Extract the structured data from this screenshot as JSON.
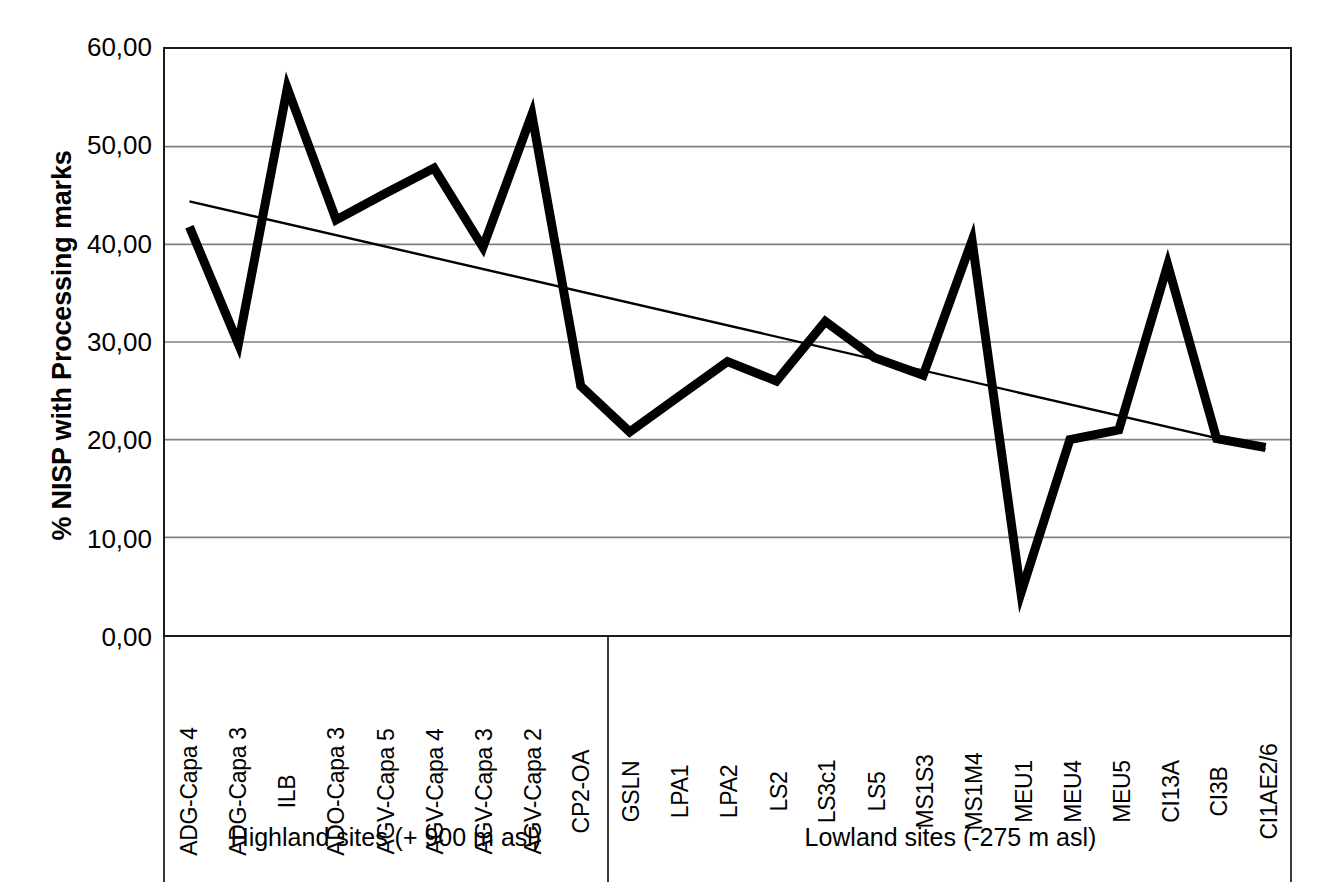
{
  "chart_data": {
    "type": "line",
    "title": "",
    "xlabel": "",
    "ylabel": "% NISP with Processing marks",
    "ylim": [
      0,
      60
    ],
    "ytick_labels": [
      "60,00",
      "50,00",
      "40,00",
      "30,00",
      "20,00",
      "10,00",
      "0,00"
    ],
    "ytick_values": [
      60,
      50,
      40,
      30,
      20,
      10,
      0
    ],
    "grid": "horizontal",
    "legend": "none",
    "categories": [
      "ADG-Capa 4",
      "ADG-Capa 3",
      "ILB",
      "ADO-Capa 3",
      "AGV-Capa 5",
      "AGV-Capa 4",
      "AGV-Capa 3",
      "AGV-Capa 2",
      "CP2-OA",
      "GSLN",
      "LPA1",
      "LPA2",
      "LS2",
      "LS3c1",
      "LS5",
      "MS1S3",
      "MS1M4",
      "MEU1",
      "MEU4",
      "MEU5",
      "CI13A",
      "CI3B",
      "CI1AE2/6"
    ],
    "series": [
      {
        "name": "% NISP with Processing marks",
        "values": [
          41.8,
          29.8,
          56.0,
          42.5,
          45.2,
          47.8,
          39.7,
          53.3,
          25.5,
          20.8,
          24.4,
          28.0,
          26.0,
          32.1,
          28.4,
          26.6,
          40.4,
          4.3,
          20.0,
          21.0,
          37.9,
          20.1,
          19.2
        ]
      },
      {
        "name": "Linear trendline",
        "type": "trendline",
        "endpoints": [
          {
            "x_index": 0,
            "value": 44.4
          },
          {
            "x_index": 22,
            "value": 19.0
          }
        ]
      }
    ],
    "groups": [
      {
        "label": "Highland sites (+ 900 m asl)",
        "start_index": 0,
        "end_index": 8
      },
      {
        "label": "Lowland sites (-275 m asl)",
        "start_index": 9,
        "end_index": 22
      }
    ],
    "colors": {
      "series_line": "#000000",
      "trendline": "#000000",
      "gridline": "#808080",
      "axis": "#1a1a1a",
      "background": "#ffffff"
    }
  }
}
